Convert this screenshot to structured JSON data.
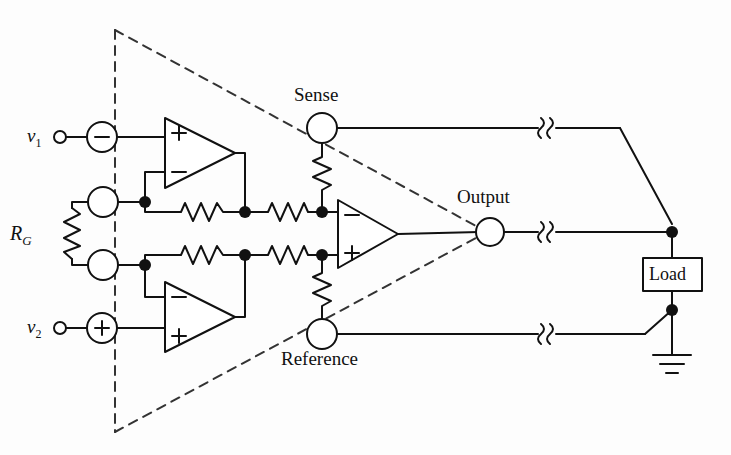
{
  "figure": {
    "type": "circuit-schematic",
    "background_color": "#fdfdfd",
    "line_color": "#111111",
    "dashed_boundary_color": "#333333"
  },
  "labels": {
    "v1": "v",
    "v1_sub": "1",
    "v2": "v",
    "v2_sub": "2",
    "rg": "R",
    "rg_sub": "G",
    "sense": "Sense",
    "reference": "Reference",
    "output": "Output",
    "load": "Load"
  },
  "symbols": {
    "source_minus": "−",
    "source_plus": "+",
    "opamp_plus": "+",
    "opamp_minus": "−"
  },
  "nodes": [
    {
      "name": "v1-terminal",
      "x": 60,
      "y": 137,
      "kind": "open-terminal"
    },
    {
      "name": "v1-source",
      "x": 102,
      "y": 137,
      "kind": "source-circle",
      "sign": "−"
    },
    {
      "name": "rg-top-circle",
      "x": 103,
      "y": 202,
      "kind": "open-circle"
    },
    {
      "name": "rg-bottom-circle",
      "x": 103,
      "y": 265,
      "kind": "open-circle"
    },
    {
      "name": "v2-terminal",
      "x": 60,
      "y": 328,
      "kind": "open-terminal"
    },
    {
      "name": "v2-source",
      "x": 102,
      "y": 328,
      "kind": "source-circle",
      "sign": "+"
    },
    {
      "name": "sense-terminal",
      "x": 322,
      "y": 128,
      "kind": "open-circle"
    },
    {
      "name": "reference-terminal",
      "x": 322,
      "y": 334,
      "kind": "open-circle"
    },
    {
      "name": "output-terminal",
      "x": 490,
      "y": 232,
      "kind": "open-circle"
    },
    {
      "name": "junction-inv-top",
      "x": 145,
      "y": 202,
      "kind": "solid-dot"
    },
    {
      "name": "junction-inv-bottom",
      "x": 145,
      "y": 265,
      "kind": "solid-dot"
    },
    {
      "name": "junction-bridge-top",
      "x": 245,
      "y": 212,
      "kind": "solid-dot"
    },
    {
      "name": "junction-bridge-bottom",
      "x": 245,
      "y": 255,
      "kind": "solid-dot"
    },
    {
      "name": "junction-amp-minus",
      "x": 322,
      "y": 212,
      "kind": "solid-dot"
    },
    {
      "name": "junction-amp-plus",
      "x": 322,
      "y": 255,
      "kind": "solid-dot"
    },
    {
      "name": "load-top-junction",
      "x": 672,
      "y": 232,
      "kind": "solid-dot"
    },
    {
      "name": "load-bottom-junction",
      "x": 672,
      "y": 310,
      "kind": "solid-dot"
    }
  ],
  "components": {
    "opamp_top": {
      "name": "upper-input-opamp",
      "x1": 165,
      "y_top": 118,
      "y_bot": 188,
      "apex_x": 235,
      "pin_top": "+",
      "pin_bottom": "−"
    },
    "opamp_bottom": {
      "name": "lower-input-opamp",
      "x1": 165,
      "y_top": 282,
      "y_bot": 352,
      "apex_x": 235,
      "pin_top": "−",
      "pin_bottom": "+"
    },
    "opamp_center": {
      "name": "difference-amplifier-opamp",
      "x1": 338,
      "y_top": 200,
      "y_bot": 268,
      "apex_x": 398,
      "pin_top": "−",
      "pin_bottom": "+"
    },
    "resistor_rg": {
      "name": "gain-resistor-RG",
      "orientation": "vertical",
      "x": 72,
      "y1": 202,
      "y2": 265
    },
    "resistor_fb_top": {
      "name": "feedback-resistor-top",
      "orientation": "horizontal",
      "y": 212,
      "x1": 175,
      "x2": 228
    },
    "resistor_fb_bottom": {
      "name": "feedback-resistor-bottom",
      "orientation": "horizontal",
      "y": 255,
      "x1": 175,
      "x2": 228
    },
    "resistor_bridge_top": {
      "name": "bridge-resistor-top",
      "orientation": "horizontal",
      "y": 212,
      "x1": 262,
      "x2": 312
    },
    "resistor_bridge_bottom": {
      "name": "bridge-resistor-bottom",
      "orientation": "horizontal",
      "y": 255,
      "x1": 262,
      "x2": 312
    },
    "resistor_sense": {
      "name": "sense-resistor",
      "orientation": "vertical",
      "x": 322,
      "y1": 150,
      "y2": 200
    },
    "resistor_reference": {
      "name": "reference-resistor",
      "orientation": "vertical",
      "x": 322,
      "y1": 268,
      "y2": 318
    },
    "load_box": {
      "name": "load-box",
      "x": 643,
      "y": 258,
      "w": 59,
      "h": 33
    },
    "ground": {
      "name": "ground-symbol",
      "x": 672,
      "y": 355
    }
  },
  "wire_breaks": [
    {
      "name": "wire-break-sense",
      "x": 546,
      "y": 128
    },
    {
      "name": "wire-break-output",
      "x": 546,
      "y": 232
    },
    {
      "name": "wire-break-reference",
      "x": 546,
      "y": 334
    }
  ],
  "dashed_boundary": {
    "name": "amplifier-boundary-triangle",
    "apex_top": [
      115,
      30
    ],
    "apex_bottom": [
      115,
      432
    ],
    "converge_point": [
      487,
      232
    ],
    "style": "dashed"
  }
}
